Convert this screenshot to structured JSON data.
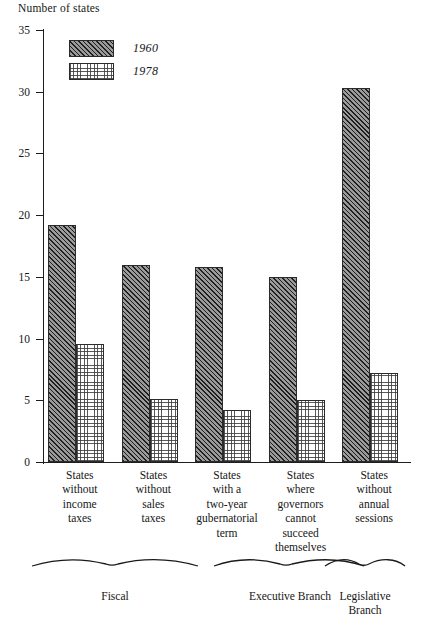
{
  "chart_data": {
    "type": "bar",
    "title": "",
    "ylabel": "Number of states",
    "xlabel": "",
    "ylim": [
      0,
      35
    ],
    "yticks": [
      0,
      5,
      10,
      15,
      20,
      25,
      30,
      35
    ],
    "grid": false,
    "legend_position": "top-left",
    "categories": [
      "States without income taxes",
      "States without sales taxes",
      "States with a two-year gubernatorial term",
      "States where governors cannot succeed themselves",
      "States without annual sessions"
    ],
    "category_lines": [
      [
        "States",
        "without",
        "income",
        "taxes"
      ],
      [
        "States",
        "without",
        "sales",
        "taxes"
      ],
      [
        "States",
        "with a",
        "two-year",
        "gubernatorial",
        "term"
      ],
      [
        "States",
        "where",
        "governors",
        "cannot",
        "succeed",
        "themselves"
      ],
      [
        "States",
        "without",
        "annual",
        "sessions"
      ]
    ],
    "series": [
      {
        "name": "1960",
        "pattern": "diagonal-hatch",
        "values": [
          19.2,
          16.0,
          15.8,
          15.0,
          30.3
        ]
      },
      {
        "name": "1978",
        "pattern": "dotted-grid",
        "values": [
          9.6,
          5.1,
          4.2,
          5.0,
          7.2
        ]
      }
    ],
    "groups": [
      {
        "label": "Fiscal",
        "categories": [
          0,
          1
        ]
      },
      {
        "label": "Executive Branch",
        "categories": [
          2,
          3
        ]
      },
      {
        "label": "Legislative Branch",
        "categories": [
          4
        ]
      }
    ],
    "colors": {
      "axis": "#1d1d1d",
      "bar_outline": "#2b2b2b",
      "series_1960_fill": "#9a9a9a",
      "series_1978_fill": "#ffffff",
      "text": "#161616",
      "background": "#ffffff"
    }
  },
  "y_tick_labels": [
    "0",
    "5",
    "10",
    "15",
    "20",
    "25",
    "30",
    "35"
  ],
  "legend": {
    "items": [
      {
        "label": "1960"
      },
      {
        "label": "1978"
      }
    ]
  },
  "group_labels": {
    "fiscal": "Fiscal",
    "executive": "Executive Branch",
    "legislative_line1": "Legislative",
    "legislative_line2": "Branch"
  }
}
